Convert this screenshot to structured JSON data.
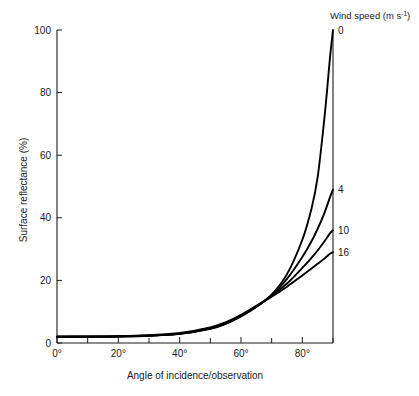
{
  "chart_data": {
    "type": "line",
    "title": "",
    "xlabel": "Angle of incidence/observation",
    "ylabel": "Surface reflectance (%)",
    "xlim": [
      0,
      90
    ],
    "ylim": [
      0,
      100
    ],
    "grid": false,
    "legend_position": "right-inline-labels",
    "legend_title": "Wind speed (m s",
    "legend_title_sup": "-1",
    "legend_title_close": ")",
    "xticks": [
      0,
      20,
      40,
      60,
      80
    ],
    "xtick_labels": [
      "0°",
      "20°",
      "40°",
      "60°",
      "80°"
    ],
    "xminor_ticks": [
      10,
      30,
      50,
      70,
      90
    ],
    "yticks": [
      0,
      20,
      40,
      60,
      80,
      100
    ],
    "ytick_labels": [
      "0",
      "20",
      "40",
      "60",
      "80",
      "100"
    ],
    "series": [
      {
        "name": "0",
        "label": "0",
        "unit": "m s^-1",
        "endpoint_value": 100,
        "x": [
          0,
          10,
          20,
          30,
          40,
          50,
          55,
          60,
          65,
          70,
          75,
          80,
          83,
          85,
          87,
          88,
          89,
          90
        ],
        "values": [
          2.0,
          2.0,
          2.1,
          2.3,
          2.9,
          4.5,
          6.1,
          8.5,
          11.5,
          15.5,
          22.0,
          33.0,
          43.0,
          53.0,
          70.0,
          80.0,
          91.0,
          100.0
        ]
      },
      {
        "name": "4",
        "label": "4",
        "unit": "m s^-1",
        "endpoint_value": 49,
        "x": [
          0,
          10,
          20,
          30,
          40,
          50,
          55,
          60,
          65,
          70,
          75,
          80,
          83,
          85,
          87,
          89,
          90
        ],
        "values": [
          2.0,
          2.0,
          2.1,
          2.3,
          2.9,
          4.6,
          6.2,
          8.6,
          11.6,
          15.2,
          20.5,
          27.5,
          32.5,
          36.5,
          41.0,
          46.5,
          49.0
        ]
      },
      {
        "name": "10",
        "label": "10",
        "unit": "m s^-1",
        "endpoint_value": 36,
        "x": [
          0,
          10,
          20,
          30,
          40,
          50,
          55,
          60,
          65,
          70,
          75,
          80,
          83,
          85,
          87,
          89,
          90
        ],
        "values": [
          2.0,
          2.0,
          2.1,
          2.4,
          3.0,
          4.8,
          6.4,
          8.8,
          11.8,
          15.0,
          19.0,
          24.0,
          27.2,
          29.6,
          32.2,
          35.0,
          36.0
        ]
      },
      {
        "name": "16",
        "label": "16",
        "unit": "m s^-1",
        "endpoint_value": 29,
        "x": [
          0,
          10,
          20,
          30,
          40,
          50,
          55,
          60,
          65,
          70,
          75,
          80,
          83,
          85,
          87,
          89,
          90
        ],
        "values": [
          2.0,
          2.1,
          2.2,
          2.5,
          3.2,
          5.0,
          6.6,
          9.0,
          11.9,
          14.8,
          18.0,
          21.6,
          23.8,
          25.3,
          26.8,
          28.5,
          29.0
        ]
      }
    ]
  },
  "geometry": {
    "plot_left": 57,
    "plot_right": 333,
    "plot_top": 30,
    "plot_bottom": 343
  }
}
